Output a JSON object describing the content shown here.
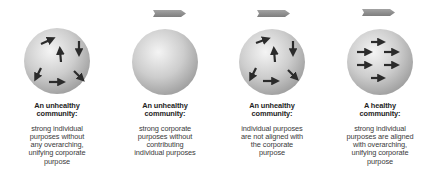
{
  "colors": {
    "sphere_light": "#f2f2f2",
    "sphere_mid": "#c9c9c9",
    "sphere_dark": "#9a9a9a",
    "arrow": "#2b2b2b",
    "banner": "#8a8a8a",
    "text": "#2a2a2a"
  },
  "panels": [
    {
      "title_line1": "An unhealthy",
      "title_line2": "community:",
      "desc": [
        "strong individual",
        "purposes without",
        "any overarching,",
        "unifying corporate",
        "purpose"
      ],
      "has_banner": false,
      "arrows": "random"
    },
    {
      "title_line1": "An unhealthy",
      "title_line2": "community:",
      "desc": [
        "strong corporate",
        "purposes without",
        "contributing",
        "individual purposes"
      ],
      "has_banner": true,
      "arrows": "none"
    },
    {
      "title_line1": "An unhealthy",
      "title_line2": "community:",
      "desc": [
        "individual purposes",
        "are not aligned with",
        "the corporate",
        "purpose"
      ],
      "has_banner": true,
      "arrows": "random"
    },
    {
      "title_line1": "A healthy",
      "title_line2": "community:",
      "desc": [
        "strong individual",
        "purposes are aligned",
        "with overarching,",
        "unifying corporate",
        "purpose"
      ],
      "has_banner": true,
      "arrows": "aligned-right"
    }
  ]
}
